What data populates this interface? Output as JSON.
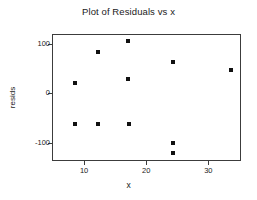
{
  "chart_data": {
    "type": "scatter",
    "title": "Plot of Residuals vs x",
    "xlabel": "x",
    "ylabel": "resids",
    "xlim": [
      5.0,
      35.1
    ],
    "ylim": [
      -135.0,
      118.0
    ],
    "grid": false,
    "legend": null,
    "marker": {
      "shape": "square",
      "color": "#111111",
      "size_px": 4
    },
    "xticks": [
      10,
      20,
      30
    ],
    "xtick_labels": [
      "10",
      "20",
      "30"
    ],
    "yticks": [
      100,
      0,
      -100
    ],
    "ytick_labels": [
      "100",
      "0",
      "-100"
    ],
    "x": [
      8.5,
      8.5,
      12.3,
      12.3,
      17.0,
      17.0,
      17.2,
      24.3,
      24.3,
      24.3,
      33.6
    ],
    "y": [
      21,
      -62,
      84,
      -62,
      105,
      28,
      -62,
      64,
      -101,
      -120,
      48
    ],
    "points": [
      {
        "x": 8.5,
        "y": 21
      },
      {
        "x": 8.5,
        "y": -62
      },
      {
        "x": 12.3,
        "y": 84
      },
      {
        "x": 12.3,
        "y": -62
      },
      {
        "x": 17.0,
        "y": 105
      },
      {
        "x": 17.0,
        "y": 28
      },
      {
        "x": 17.2,
        "y": -62
      },
      {
        "x": 24.3,
        "y": 64
      },
      {
        "x": 24.3,
        "y": -101
      },
      {
        "x": 24.3,
        "y": -120
      },
      {
        "x": 33.6,
        "y": 48
      }
    ]
  },
  "figure": {
    "background": "#ffffff",
    "axis_color": "#3c3c3c",
    "text_color": "#1a1a1a"
  }
}
